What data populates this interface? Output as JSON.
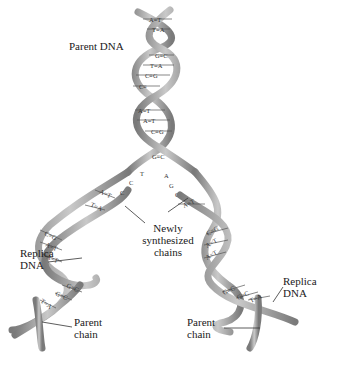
{
  "diagram": {
    "labels": {
      "parent_dna": "Parent DNA",
      "newly_synthesized": [
        "Newly",
        "synthesized",
        "chains"
      ],
      "replica_dna_left": [
        "Replica",
        "DNA"
      ],
      "replica_dna_right": [
        "Replica",
        "DNA"
      ],
      "parent_chain_left": [
        "Parent",
        "chain"
      ],
      "parent_chain_right": [
        "Parent",
        "chain"
      ]
    },
    "parent_base_pairs": [
      "A=T",
      "T=A",
      "G≡C",
      "T=A",
      "C≡G",
      "C≡",
      "A=T",
      "A=T",
      "C≡G",
      "G≡C"
    ],
    "fork_left_bases": [
      "T",
      "C",
      "C"
    ],
    "fork_right_bases": [
      "A",
      "G",
      "G"
    ],
    "left_replica_base_pairs": [
      "A=T",
      "T=A",
      "C≡G",
      "A=T",
      "A=T",
      "G≡C",
      "G≡C",
      "T=A"
    ],
    "right_replica_base_pairs": [
      "A=T",
      "C≡G",
      "A=T",
      "A=T",
      "G≡C",
      "G≡C",
      "T=A"
    ],
    "colors": {
      "strand": "#8a8a8a",
      "strand_highlight": "#c8c8c8",
      "text": "#1a1a1a",
      "background": "#ffffff"
    }
  }
}
